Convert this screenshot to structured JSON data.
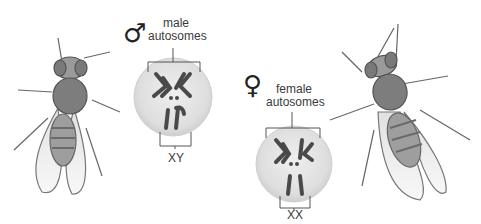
{
  "figure": {
    "type": "sex chromosome diagram (Drosophila)",
    "male": {
      "symbol": "♂",
      "label_line1": "male",
      "label_line2": "autosomes",
      "sex_chromosomes": "XY"
    },
    "female": {
      "symbol": "♀",
      "label_line1": "female",
      "label_line2": "autosomes",
      "sex_chromosomes": "XX"
    }
  },
  "colors": {
    "nucleus_fill": "#e4e4e4",
    "chromosome": "#4a4a4a",
    "bracket": "#555555",
    "fly_body": "#8a8a8a"
  }
}
